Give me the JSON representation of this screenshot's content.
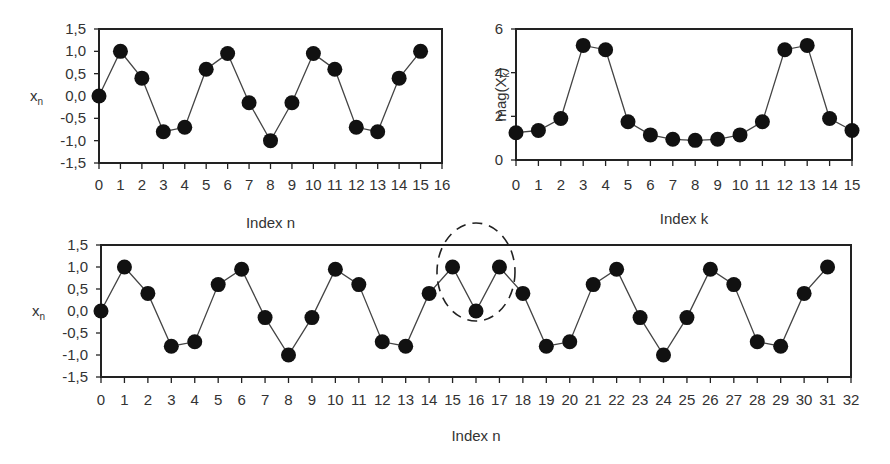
{
  "chart_data": [
    {
      "id": "top-left",
      "type": "line",
      "title": "",
      "xlabel": "Index n",
      "ylabel": "x_n",
      "ylabel_main": "x",
      "ylabel_sub": "n",
      "xlim": [
        0,
        16
      ],
      "ylim": [
        -1.5,
        1.5
      ],
      "xticks": [
        "0",
        "1",
        "2",
        "3",
        "4",
        "5",
        "6",
        "7",
        "8",
        "9",
        "10",
        "11",
        "12",
        "13",
        "14",
        "15",
        "16"
      ],
      "yticks": [
        "1,5",
        "1,0",
        "0,5",
        "0,0",
        "-0,5",
        "-1,0",
        "-1,5"
      ],
      "grid": false,
      "x": [
        0,
        1,
        2,
        3,
        4,
        5,
        6,
        7,
        8,
        9,
        10,
        11,
        12,
        13,
        14,
        15
      ],
      "values": [
        0.0,
        1.0,
        0.4,
        -0.8,
        -0.7,
        0.6,
        0.95,
        -0.15,
        -1.0,
        -0.15,
        0.95,
        0.6,
        -0.7,
        -0.8,
        0.4,
        1.0
      ]
    },
    {
      "id": "top-right",
      "type": "line",
      "title": "",
      "xlabel": "Index k",
      "ylabel": "mag(X_k)",
      "ylabel_main": "mag(X",
      "ylabel_sub": "k",
      "ylabel_close": ")",
      "xlim": [
        0,
        15
      ],
      "ylim": [
        0,
        6
      ],
      "xticks": [
        "0",
        "1",
        "2",
        "3",
        "4",
        "5",
        "6",
        "7",
        "8",
        "9",
        "10",
        "11",
        "12",
        "13",
        "14",
        "15"
      ],
      "yticks": [
        "6",
        "4",
        "2",
        "0"
      ],
      "grid": false,
      "x": [
        0,
        1,
        2,
        3,
        4,
        5,
        6,
        7,
        8,
        9,
        10,
        11,
        12,
        13,
        14,
        15
      ],
      "values": [
        1.25,
        1.35,
        1.9,
        5.25,
        5.05,
        1.75,
        1.15,
        0.95,
        0.9,
        0.95,
        1.15,
        1.75,
        5.05,
        5.25,
        1.9,
        1.35
      ]
    },
    {
      "id": "bottom",
      "type": "line",
      "title": "",
      "xlabel": "Index n",
      "ylabel": "x_n",
      "ylabel_main": "x",
      "ylabel_sub": "n",
      "xlim": [
        0,
        32
      ],
      "ylim": [
        -1.5,
        1.5
      ],
      "xticks": [
        "0",
        "1",
        "2",
        "3",
        "4",
        "5",
        "6",
        "7",
        "8",
        "9",
        "10",
        "11",
        "12",
        "13",
        "14",
        "15",
        "16",
        "17",
        "18",
        "19",
        "20",
        "21",
        "22",
        "23",
        "24",
        "25",
        "26",
        "27",
        "28",
        "29",
        "30",
        "31",
        "32"
      ],
      "yticks": [
        "1,5",
        "1,0",
        "0,5",
        "0,0",
        "-0,5",
        "-1,0",
        "-1,5"
      ],
      "grid": false,
      "x": [
        0,
        1,
        2,
        3,
        4,
        5,
        6,
        7,
        8,
        9,
        10,
        11,
        12,
        13,
        14,
        15,
        16,
        17,
        18,
        19,
        20,
        21,
        22,
        23,
        24,
        25,
        26,
        27,
        28,
        29,
        30,
        31
      ],
      "values": [
        0.0,
        1.0,
        0.4,
        -0.8,
        -0.7,
        0.6,
        0.95,
        -0.15,
        -1.0,
        -0.15,
        0.95,
        0.6,
        -0.7,
        -0.8,
        0.4,
        1.0,
        0.0,
        1.0,
        0.4,
        -0.8,
        -0.7,
        0.6,
        0.95,
        -0.15,
        -1.0,
        -0.15,
        0.95,
        0.6,
        -0.7,
        -0.8,
        0.4,
        1.0
      ],
      "annotations": [
        {
          "type": "dashed-ellipse",
          "around_x": [
            15,
            16,
            17
          ],
          "note": "discontinuity at n=16 highlighted"
        }
      ]
    }
  ],
  "colors": {
    "frame": "#222222",
    "line": "#444444",
    "marker": "#111111",
    "text": "#333333"
  }
}
